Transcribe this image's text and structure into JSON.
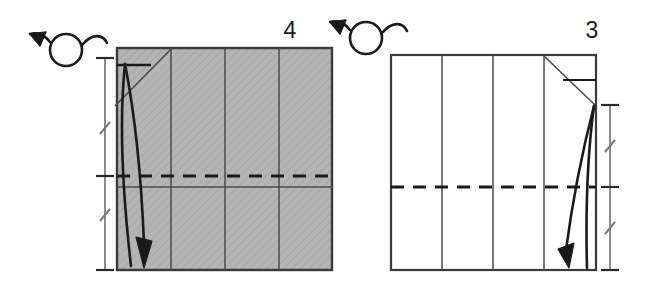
{
  "figure": {
    "type": "origami-instruction-diagram",
    "background_color": "#ffffff",
    "ink_color": "#1a1a1a",
    "panel_count": 2,
    "reading_order": "right-to-left"
  },
  "panels": [
    {
      "id": "panel-step-4",
      "step_number": "4",
      "position": "left",
      "paper_side": "colored",
      "paper_fill": "#b3b3b3",
      "paper_border": "#333333",
      "sheet": {
        "x": 117,
        "y": 48,
        "width": 215,
        "height": 222
      },
      "vertical_fold_creases": [
        171,
        225,
        279
      ],
      "horizontal_valley_fold_dashed_y": 176,
      "horizontal_thin_crease_y": 187,
      "diagonal_crease": {
        "x1": 171,
        "y1": 48,
        "x2": 117,
        "y2": 103
      },
      "tick_mark": {
        "x1": 117,
        "y1": 65,
        "x2": 150,
        "y2": 65
      },
      "fold_arrow": {
        "kind": "curved-valley-fold-arrow",
        "from_y": 64,
        "to_y": 268,
        "direction": "down"
      },
      "dimension_line": {
        "x": 105,
        "top_y": 58,
        "mid_y": 176,
        "bottom_y": 270,
        "cap_half_width": 9,
        "hash_marks": 2,
        "hash_y": [
          128,
          215
        ],
        "meaning": "equal-halves"
      },
      "turn_over_symbol": {
        "name": "turn-over-icon",
        "circle_center_x": 66,
        "circle_center_y": 50,
        "circle_radius": 16,
        "arrow_direction": "left"
      }
    },
    {
      "id": "panel-step-3",
      "step_number": "3",
      "position": "right",
      "paper_side": "white",
      "paper_fill": "#ffffff",
      "paper_border": "#333333",
      "sheet": {
        "x": 391,
        "y": 55,
        "width": 205,
        "height": 215
      },
      "vertical_fold_creases": [
        442,
        493,
        544
      ],
      "horizontal_valley_fold_dashed_y": 187,
      "horizontal_thin_crease_y": 187,
      "diagonal_crease": {
        "x1": 544,
        "y1": 55,
        "x2": 596,
        "y2": 105
      },
      "tick_mark": {
        "x1": 563,
        "y1": 80,
        "x2": 596,
        "y2": 80
      },
      "fold_arrow": {
        "kind": "curved-valley-fold-arrow",
        "from_y": 106,
        "to_y": 268,
        "direction": "down"
      },
      "dimension_line": {
        "x": 610,
        "top_y": 105,
        "mid_y": 187,
        "bottom_y": 270,
        "cap_half_width": 9,
        "hash_marks": 2,
        "hash_y": [
          146,
          228
        ],
        "meaning": "equal-halves"
      },
      "turn_over_symbol": {
        "name": "turn-over-icon",
        "circle_center_x": 366,
        "circle_center_y": 38,
        "circle_radius": 16,
        "arrow_direction": "left"
      }
    }
  ],
  "labels": {
    "step_4_number": "4",
    "step_4_number_x": 290,
    "step_4_number_y": 38,
    "step_3_number": "3",
    "step_3_number_x": 592,
    "step_3_number_y": 38
  },
  "colors": {
    "paper_colored_fill": "#b3b3b3",
    "paper_white_fill": "#ffffff",
    "outline": "#333333",
    "crease_line": "#555555",
    "ink": "#1a1a1a"
  }
}
